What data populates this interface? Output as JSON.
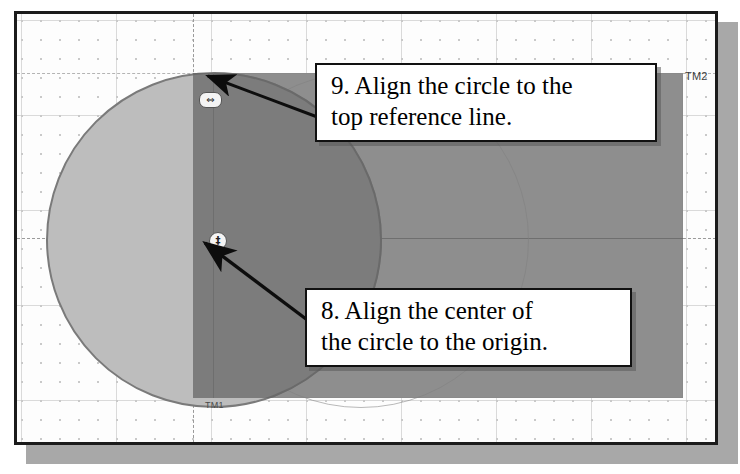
{
  "figure": {
    "type": "cad-sketch-instruction",
    "application_hint": "parametric CAD sketch viewport"
  },
  "canvas": {
    "background_color": "#fdfdfd",
    "border_color": "#1b1b1b",
    "grid": {
      "visible": true,
      "dot_color": "#c9c9c9",
      "major_line_color": "#dadada"
    },
    "datum_labels": [
      {
        "id": "datum-2",
        "text": "TM2"
      },
      {
        "id": "datum-1",
        "text": "TM1"
      }
    ]
  },
  "geometry": {
    "circle": {
      "name": "circle-profile",
      "fill_color": "#bdbdbd",
      "edge_color": "#7a7a7a",
      "center_aligned_to": "origin"
    },
    "rectangle": {
      "name": "rectangle-body",
      "fill_color": "#8e8e8e",
      "edge_color": "#8a8a8a"
    },
    "overlap": {
      "name": "circle-rectangle-overlap",
      "fill_color": "#7c7c7c"
    },
    "reference_lines": {
      "top_reference_line_color": "#b4b4b4",
      "horizontal_axis_color": "#9a9a9a",
      "vertical_axis_color": "#9a9a9a"
    }
  },
  "markers": [
    {
      "id": "top-align-marker",
      "icon": "horizontal-arrow-snap-icon",
      "glyph": "⇔",
      "tooltip": "coincident / horizontal alignment snap"
    },
    {
      "id": "origin-marker",
      "icon": "origin-point-icon",
      "glyph": "‡",
      "tooltip": "sketch origin"
    }
  ],
  "callouts": [
    {
      "id": "callout-9",
      "number": "9.",
      "line1": "9. Align the circle to the",
      "line2": "top reference line.",
      "arrow_target": "circle-top-quadrant"
    },
    {
      "id": "callout-8",
      "number": "8.",
      "line1": "8. Align the center of",
      "line2": "the circle to the origin.",
      "arrow_target": "origin-marker"
    }
  ],
  "colors": {
    "callout_border": "#111111",
    "callout_background": "#ffffff",
    "arrow_color": "#0d0d0d",
    "page_shadow": "#a8a8a8"
  }
}
